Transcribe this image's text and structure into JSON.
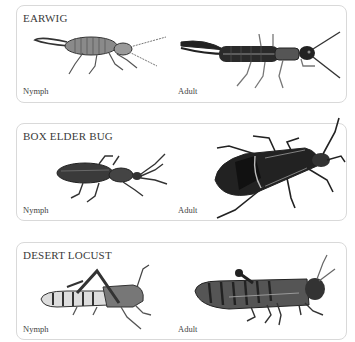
{
  "panels": [
    {
      "title": "EARWIG",
      "nymph_label": "Nymph",
      "adult_label": "Adult",
      "nymph_icon": "earwig-nymph-illustration",
      "adult_icon": "earwig-adult-illustration"
    },
    {
      "title": "BOX ELDER BUG",
      "nymph_label": "Nymph",
      "adult_label": "Adult",
      "nymph_icon": "box-elder-bug-nymph-illustration",
      "adult_icon": "box-elder-bug-adult-illustration"
    },
    {
      "title": "DESERT LOCUST",
      "nymph_label": "Nymph",
      "adult_label": "Adult",
      "nymph_icon": "desert-locust-nymph-illustration",
      "adult_icon": "desert-locust-adult-illustration"
    }
  ],
  "colors": {
    "panel_border": "#d9d9d9",
    "text": "#3a3a3a",
    "insect_dark": "#222222",
    "insect_mid": "#777777"
  }
}
